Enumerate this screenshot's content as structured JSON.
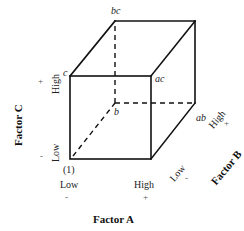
{
  "diagram": {
    "type": "factorial-design-cube",
    "vertices": {
      "origin": "(1)",
      "a": "",
      "b": "b",
      "ab": "ab",
      "c": "c",
      "ac": "ac",
      "bc": "bc",
      "abc": ""
    },
    "factor_a": {
      "title": "Factor A",
      "low_label": "Low",
      "high_label": "High",
      "low_sign": "-",
      "high_sign": "+"
    },
    "factor_b": {
      "title": "Factor B",
      "low_label": "Low",
      "high_label": "High",
      "low_sign": "-",
      "high_sign": "+"
    },
    "factor_c": {
      "title": "Factor C",
      "low_label": "Low",
      "high_label": "High",
      "low_sign": "-",
      "high_sign": "+"
    },
    "colors": {
      "edge": "#111111",
      "background": "#ffffff"
    }
  }
}
